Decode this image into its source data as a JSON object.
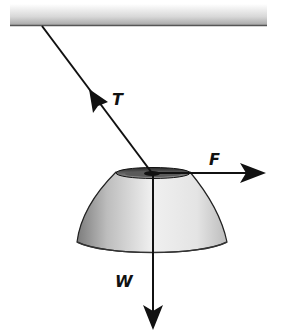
{
  "diagram": {
    "ceiling": {
      "label": ""
    },
    "forces": [
      {
        "symbol": "T",
        "name": "tension",
        "direction": "up-left along rope"
      },
      {
        "symbol": "F",
        "name": "applied force",
        "direction": "right (horizontal)"
      },
      {
        "symbol": "W",
        "name": "weight",
        "direction": "down (vertical)"
      }
    ],
    "labels": {
      "T": "T",
      "F": "F",
      "W": "W"
    },
    "colors": {
      "line": "#111111",
      "body_light": "#f2f2f2",
      "body_dark": "#8a8a8a",
      "ceiling_top": "#ffffff",
      "ceiling_bottom": "#9a9a9a"
    }
  }
}
